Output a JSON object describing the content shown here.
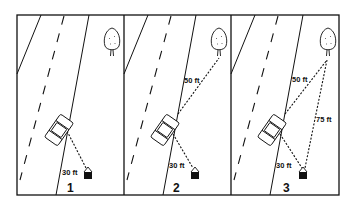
{
  "diagram": {
    "panels": [
      {
        "number": "1",
        "measurements": [
          {
            "label": "30 ft"
          }
        ]
      },
      {
        "number": "2",
        "measurements": [
          {
            "label": "50 ft"
          },
          {
            "label": "30 ft"
          }
        ]
      },
      {
        "number": "3",
        "measurements": [
          {
            "label": "50 ft"
          },
          {
            "label": "75 ft"
          },
          {
            "label": "30 ft"
          }
        ]
      }
    ],
    "icons": [
      "car-icon",
      "house-icon",
      "tree-icon"
    ],
    "colors": {
      "ink": "#111111",
      "background": "#ffffff"
    }
  }
}
